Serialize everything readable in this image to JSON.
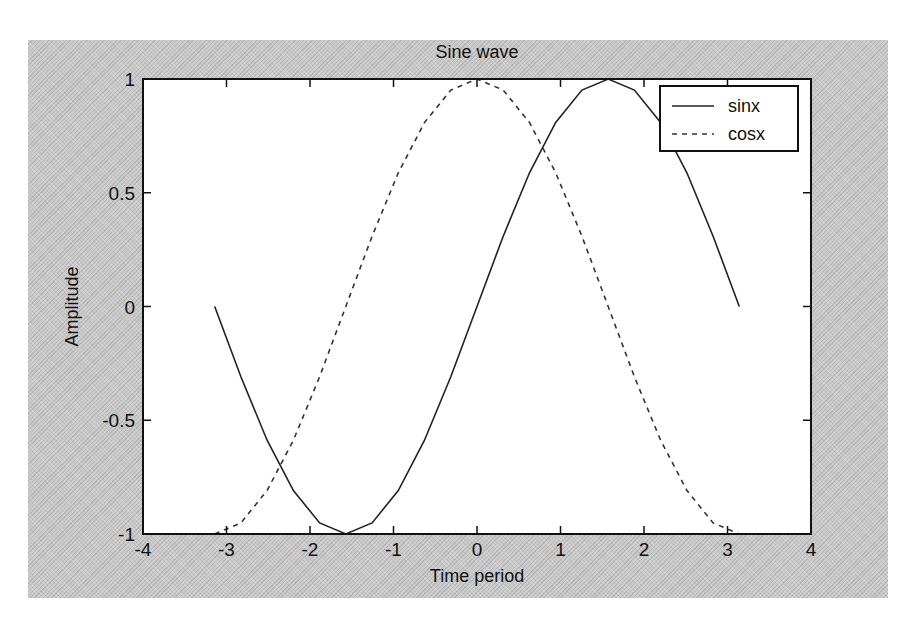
{
  "chart_data": {
    "type": "line",
    "title": "Sine wave",
    "xlabel": "Time period",
    "ylabel": "Amplitude",
    "xlim": [
      -4,
      4
    ],
    "ylim": [
      -1,
      1
    ],
    "xticks": [
      -4,
      -3,
      -2,
      -1,
      0,
      1,
      2,
      3,
      4
    ],
    "xtick_labels": [
      "-4",
      "-3",
      "-2",
      "-1",
      "0",
      "1",
      "2",
      "3",
      "4"
    ],
    "yticks": [
      -1,
      -0.5,
      0,
      0.5,
      1
    ],
    "ytick_labels": [
      "-1",
      "-0.5",
      "0",
      "0.5",
      "1"
    ],
    "grid": false,
    "legend_position": "upper right",
    "x": [
      -3.1416,
      -2.8274,
      -2.5133,
      -2.1991,
      -1.885,
      -1.5708,
      -1.2566,
      -0.9425,
      -0.6283,
      -0.3142,
      0.0,
      0.3142,
      0.6283,
      0.9425,
      1.2566,
      1.5708,
      1.885,
      2.1991,
      2.5133,
      2.8274,
      3.1416
    ],
    "series": [
      {
        "name": "sinx",
        "line_style": "solid",
        "color": "#222222",
        "values": [
          0.0,
          -0.309,
          -0.5878,
          -0.809,
          -0.9511,
          -1.0,
          -0.9511,
          -0.809,
          -0.5878,
          -0.309,
          0.0,
          0.309,
          0.5878,
          0.809,
          0.9511,
          1.0,
          0.9511,
          0.809,
          0.5878,
          0.309,
          0.0
        ]
      },
      {
        "name": "cosx",
        "line_style": "dashed",
        "color": "#333333",
        "values": [
          -1.0,
          -0.9511,
          -0.809,
          -0.5878,
          -0.309,
          0.0,
          0.309,
          0.5878,
          0.809,
          0.9511,
          1.0,
          0.9511,
          0.809,
          0.5878,
          0.309,
          0.0,
          -0.309,
          -0.5878,
          -0.809,
          -0.9511,
          -1.0
        ]
      }
    ]
  },
  "colors": {
    "figure_background": "#c8c8c8",
    "axes_background": "#ffffff",
    "axes_edge": "#111111"
  }
}
